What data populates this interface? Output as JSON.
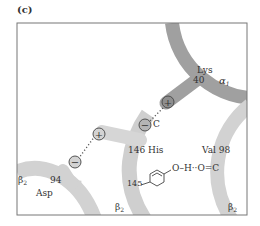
{
  "panel_label": "(c)",
  "colors": {
    "frame": "#777777",
    "ribbon_dark": "#9a9a9a",
    "ribbon_light": "#cfcfcf",
    "text": "#333333",
    "charge_dark_fill": "#8c8c8c",
    "charge_light_fill": "#cfcfcf"
  },
  "labels": {
    "lys": "Lys",
    "lys_num": "40",
    "alpha1": "α",
    "alpha1_sub": "1",
    "his": "146 His",
    "c_top": "C",
    "val": "Val 98",
    "hbond": "O–H··O=C",
    "num145": "145",
    "beta2_left": "β",
    "beta2_left_sub": "2",
    "num94": "94",
    "asp": "Asp",
    "beta2_bottom": "β",
    "beta2_bottom_sub": "2",
    "beta2_right": "β",
    "beta2_right_sub": "2"
  },
  "charges": {
    "lys_plus": "+",
    "his_minus": "−",
    "his_plus": "+",
    "asp_minus": "−"
  }
}
